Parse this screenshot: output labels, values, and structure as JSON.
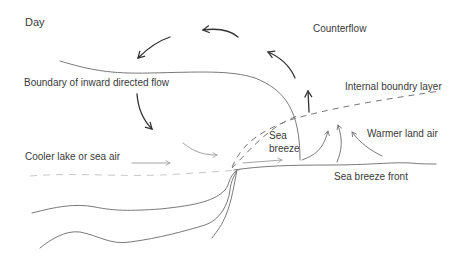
{
  "diagram": {
    "title": "Day",
    "labels": {
      "counterflow": "Counterflow",
      "boundary": "Boundary of inward directed flow",
      "internal_layer": "Internal boundry layer",
      "cooler_air": "Cooler lake or sea air",
      "sea_breeze_line1": "Sea",
      "sea_breeze_line2": "breeze",
      "warmer_air": "Warmer land air",
      "front": "Sea breeze front"
    },
    "colors": {
      "dark_arrow": "#333333",
      "mid_line": "#6a6a6a",
      "light_line": "#9a9a9a",
      "text": "#3a3a3a"
    }
  }
}
